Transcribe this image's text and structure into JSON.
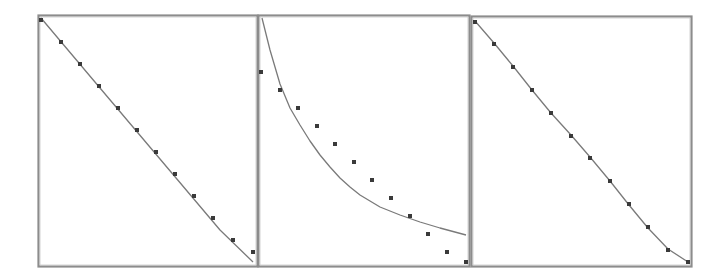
{
  "figure": {
    "background": "#ffffff",
    "frame_color": "#8c8c8c",
    "line_color": "#7a7a7a",
    "marker_color": "#3a3a3a",
    "panel_count": 3
  },
  "chart_data": [
    {
      "type": "scatter",
      "title": "",
      "xlabel": "",
      "ylabel": "",
      "grid": false,
      "legend": null,
      "description": "Linear fit closely matching evenly spaced decreasing points",
      "panel": {
        "x": 38,
        "y": 15,
        "w": 219,
        "h": 251
      },
      "points_px": [
        [
          41,
          20
        ],
        [
          61,
          42
        ],
        [
          80,
          64
        ],
        [
          99,
          86
        ],
        [
          118,
          108
        ],
        [
          137,
          130
        ],
        [
          156,
          152
        ],
        [
          175,
          174
        ],
        [
          194,
          196
        ],
        [
          213,
          218
        ],
        [
          233,
          240
        ],
        [
          253,
          252
        ]
      ],
      "curve_px": [
        [
          41,
          18
        ],
        [
          100,
          88
        ],
        [
          160,
          159
        ],
        [
          220,
          230
        ],
        [
          253,
          262
        ]
      ],
      "x": [
        0,
        1,
        2,
        3,
        4,
        5,
        6,
        7,
        8,
        9,
        10,
        11
      ],
      "y": [
        1.0,
        0.91,
        0.82,
        0.73,
        0.64,
        0.55,
        0.46,
        0.37,
        0.28,
        0.19,
        0.09,
        0.04
      ]
    },
    {
      "type": "scatter",
      "title": "",
      "xlabel": "",
      "ylabel": "",
      "grid": false,
      "legend": null,
      "description": "Hyperbolic/decaying fit curve poorly matching linearly decreasing points",
      "panel": {
        "x": 258,
        "y": 15,
        "w": 211,
        "h": 251
      },
      "points_px": [
        [
          261,
          72
        ],
        [
          280,
          90
        ],
        [
          298,
          108
        ],
        [
          317,
          126
        ],
        [
          335,
          144
        ],
        [
          354,
          162
        ],
        [
          372,
          180
        ],
        [
          391,
          198
        ],
        [
          410,
          216
        ],
        [
          428,
          234
        ],
        [
          447,
          252
        ],
        [
          466,
          262
        ]
      ],
      "curve_px": [
        [
          262,
          18
        ],
        [
          270,
          50
        ],
        [
          280,
          84
        ],
        [
          290,
          108
        ],
        [
          300,
          125
        ],
        [
          310,
          141
        ],
        [
          320,
          155
        ],
        [
          330,
          167
        ],
        [
          340,
          178
        ],
        [
          350,
          187
        ],
        [
          360,
          195
        ],
        [
          370,
          201
        ],
        [
          380,
          207
        ],
        [
          390,
          211
        ],
        [
          400,
          215
        ],
        [
          420,
          222
        ],
        [
          440,
          228
        ],
        [
          466,
          235
        ]
      ],
      "x": [
        0,
        1,
        2,
        3,
        4,
        5,
        6,
        7,
        8,
        9,
        10,
        11
      ],
      "y": [
        0.78,
        0.71,
        0.64,
        0.56,
        0.49,
        0.42,
        0.34,
        0.27,
        0.2,
        0.13,
        0.05,
        0.01
      ]
    },
    {
      "type": "scatter",
      "title": "",
      "xlabel": "",
      "ylabel": "",
      "grid": false,
      "legend": null,
      "description": "Smooth slightly S-shaped fit passing through decreasing points",
      "panel": {
        "x": 471,
        "y": 16,
        "w": 220,
        "h": 250
      },
      "points_px": [
        [
          475,
          22
        ],
        [
          494,
          44
        ],
        [
          513,
          67
        ],
        [
          532,
          90
        ],
        [
          551,
          113
        ],
        [
          571,
          136
        ],
        [
          590,
          158
        ],
        [
          610,
          181
        ],
        [
          629,
          204
        ],
        [
          648,
          227
        ],
        [
          668,
          250
        ],
        [
          688,
          262
        ]
      ],
      "curve_px": [
        [
          475,
          21
        ],
        [
          494,
          43
        ],
        [
          513,
          66
        ],
        [
          532,
          90
        ],
        [
          551,
          113
        ],
        [
          571,
          135
        ],
        [
          590,
          157
        ],
        [
          610,
          181
        ],
        [
          629,
          205
        ],
        [
          648,
          228
        ],
        [
          668,
          249
        ],
        [
          688,
          262
        ]
      ],
      "x": [
        0,
        1,
        2,
        3,
        4,
        5,
        6,
        7,
        8,
        9,
        10,
        11
      ],
      "y": [
        1.0,
        0.91,
        0.82,
        0.72,
        0.63,
        0.54,
        0.45,
        0.36,
        0.27,
        0.18,
        0.08,
        0.03
      ]
    }
  ]
}
